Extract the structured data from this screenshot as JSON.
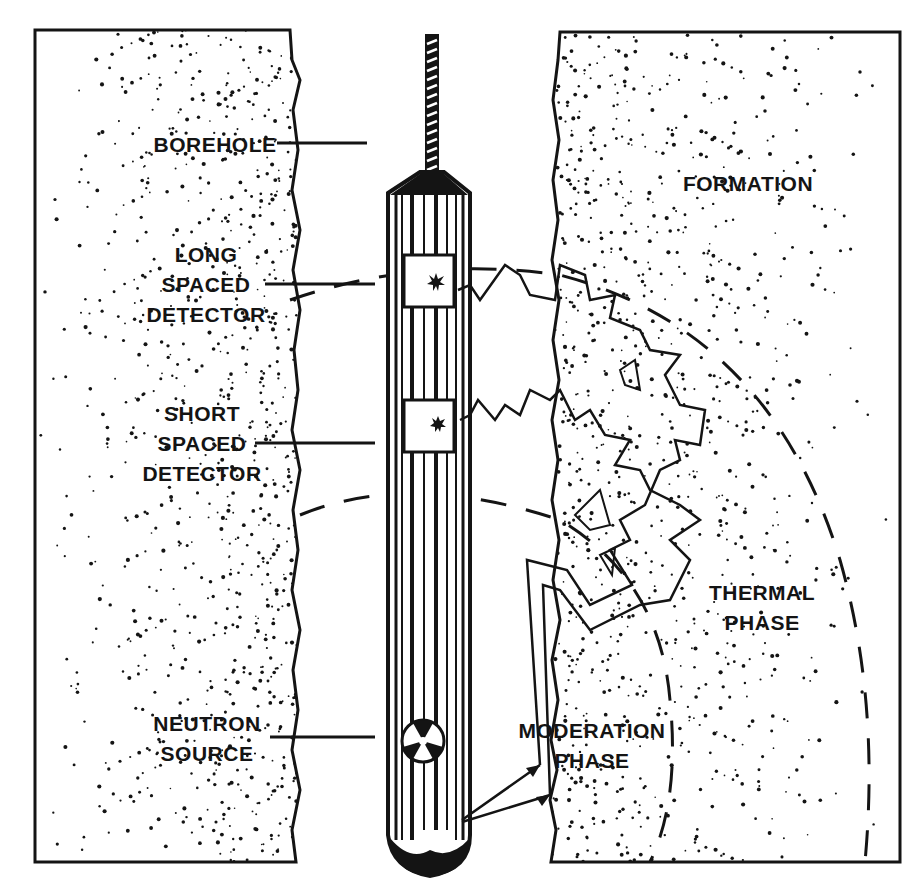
{
  "diagram": {
    "colors": {
      "ink": "#141414",
      "paper": "#ffffff"
    },
    "labels": {
      "borehole": [
        "BOREHOLE"
      ],
      "long_spaced_detector": [
        "LONG",
        "SPACED",
        "DETECTOR"
      ],
      "short_spaced_detector": [
        "SHORT",
        "SPACED",
        "DETECTOR"
      ],
      "neutron_source": [
        "NEUTRON",
        "SOURCE"
      ],
      "formation": [
        "FORMATION"
      ],
      "thermal_phase": [
        "THERMAL",
        "PHASE"
      ],
      "moderation_phase": [
        "MODERATION",
        "PHASE"
      ]
    },
    "icons": {
      "source": "radiation-trefoil-icon",
      "detector_hit": "starburst-icon"
    }
  }
}
